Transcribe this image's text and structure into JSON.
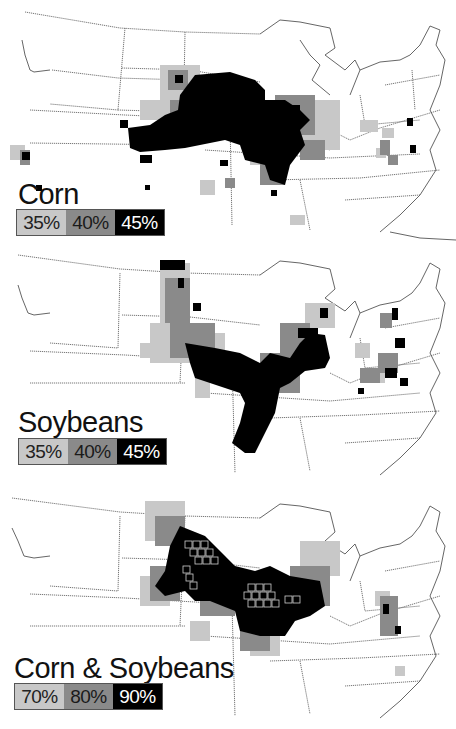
{
  "figure": {
    "panels": [
      {
        "title": "Corn",
        "legend": [
          {
            "label": "35%",
            "color": "#c8c8c8"
          },
          {
            "label": "40%",
            "color": "#8a8a8a"
          },
          {
            "label": "45%",
            "color": "#000000"
          }
        ]
      },
      {
        "title": "Soybeans",
        "legend": [
          {
            "label": "35%",
            "color": "#c8c8c8"
          },
          {
            "label": "40%",
            "color": "#8a8a8a"
          },
          {
            "label": "45%",
            "color": "#000000"
          }
        ]
      },
      {
        "title": "Corn & Soybeans",
        "legend": [
          {
            "label": "70%",
            "color": "#c8c8c8"
          },
          {
            "label": "80%",
            "color": "#8a8a8a"
          },
          {
            "label": "90%",
            "color": "#000000"
          }
        ]
      }
    ]
  }
}
